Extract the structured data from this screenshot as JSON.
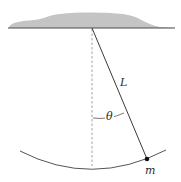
{
  "diagram": {
    "type": "simple-pendulum",
    "labels": {
      "length": "L",
      "angle": "θ",
      "mass": "m"
    },
    "colors": {
      "ceiling_fill": "#c4c4c4",
      "line": "#3a3a3a",
      "dashed": "#8a8a8a",
      "background": "#ffffff"
    }
  }
}
